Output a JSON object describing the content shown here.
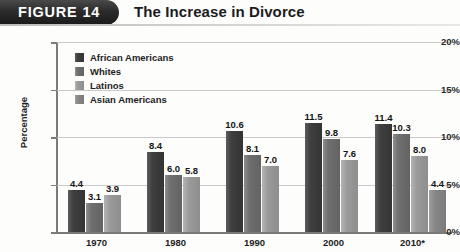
{
  "header": {
    "badge": "FIGURE 14",
    "title": "The Increase in Divorce"
  },
  "chart_data": {
    "type": "bar",
    "title": "The Increase in Divorce",
    "xlabel": "",
    "ylabel": "Percentage",
    "ylim": [
      0,
      20
    ],
    "yticks": [
      "0%",
      "5%",
      "10%",
      "15%",
      "20%"
    ],
    "ytick_values": [
      0,
      5,
      10,
      15,
      20
    ],
    "grid": true,
    "legend_position": "upper-left-inside",
    "categories": [
      "1970",
      "1980",
      "1990",
      "2000",
      "2010*"
    ],
    "series": [
      {
        "name": "African Americans",
        "color": "#3f3f3f",
        "values": [
          4.4,
          8.4,
          10.6,
          11.5,
          11.4
        ],
        "labels": [
          "4.4",
          "8.4",
          "10.6",
          "11.5",
          "11.4"
        ]
      },
      {
        "name": "Whites",
        "color": "#6f6f6f",
        "values": [
          3.1,
          6.0,
          8.1,
          9.8,
          10.3
        ],
        "labels": [
          "3.1",
          "6.0",
          "8.1",
          "9.8",
          "10.3"
        ]
      },
      {
        "name": "Latinos",
        "color": "#9a9a9a",
        "values": [
          3.9,
          5.8,
          7.0,
          7.6,
          8.0
        ],
        "labels": [
          "3.9",
          "5.8",
          "7.0",
          "7.6",
          "8.0"
        ]
      },
      {
        "name": "Asian Americans",
        "color": "#868686",
        "values": [
          null,
          null,
          null,
          null,
          4.4
        ],
        "labels": [
          "",
          "",
          "",
          "",
          "4.4"
        ]
      }
    ]
  }
}
